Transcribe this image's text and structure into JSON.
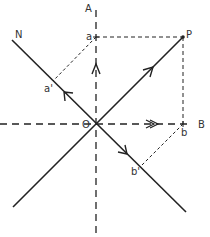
{
  "diagram": {
    "type": "vector-resolution",
    "labels": {
      "axis_a": "A",
      "axis_b": "B",
      "axis_n": "N",
      "origin": "O",
      "point_p": "P",
      "proj_a": "a",
      "proj_b": "b",
      "proj_a_prime": "a'",
      "proj_b_prime": "b'"
    },
    "points": {
      "O": [
        96,
        124
      ],
      "P": [
        183,
        37
      ],
      "a": [
        96,
        37
      ],
      "b": [
        183,
        124
      ],
      "a_prime": [
        53,
        81
      ],
      "b_prime": [
        140,
        167
      ]
    },
    "lines": [
      {
        "id": "axis-a",
        "style": "dashed",
        "from": [
          96,
          10
        ],
        "to": [
          96,
          235
        ]
      },
      {
        "id": "axis-b",
        "style": "dashed",
        "from": [
          0,
          124
        ],
        "to": [
          192,
          124
        ]
      },
      {
        "id": "axis-n",
        "style": "solid",
        "from": [
          12,
          40
        ],
        "to": [
          186,
          212
        ]
      },
      {
        "id": "vector-op-line",
        "style": "solid",
        "from": [
          13,
          207
        ],
        "to": [
          183,
          37
        ]
      },
      {
        "id": "p-to-a",
        "style": "dashed-fine",
        "from": [
          96,
          37
        ],
        "to": [
          183,
          37
        ]
      },
      {
        "id": "p-to-b",
        "style": "dashed-fine",
        "from": [
          183,
          37
        ],
        "to": [
          183,
          124
        ]
      },
      {
        "id": "a-to-a-prime",
        "style": "dashed-fine",
        "from": [
          96,
          37
        ],
        "to": [
          53,
          81
        ]
      },
      {
        "id": "b-to-b-prime",
        "style": "dashed-fine",
        "from": [
          183,
          124
        ],
        "to": [
          140,
          167
        ]
      }
    ],
    "colors": {
      "line": "#222222",
      "label": "#333333",
      "background": "#ffffff"
    }
  }
}
